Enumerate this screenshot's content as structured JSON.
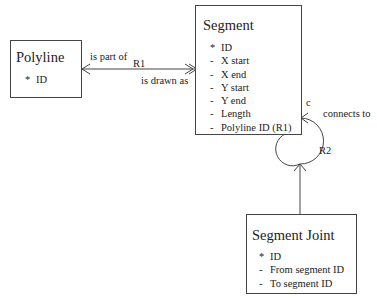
{
  "entities": {
    "polyline": {
      "title": "Polyline",
      "attributes": [
        {
          "marker": "*",
          "name": "ID"
        }
      ]
    },
    "segment": {
      "title": "Segment",
      "attributes": [
        {
          "marker": "*",
          "name": "ID"
        },
        {
          "marker": "-",
          "name": "X start"
        },
        {
          "marker": "-",
          "name": "X end"
        },
        {
          "marker": "-",
          "name": "Y start"
        },
        {
          "marker": "-",
          "name": "Y end"
        },
        {
          "marker": "-",
          "name": "Length"
        },
        {
          "marker": "-",
          "name": "Polyline ID (R1)"
        }
      ]
    },
    "segment_joint": {
      "title": "Segment Joint",
      "attributes": [
        {
          "marker": "*",
          "name": "ID"
        },
        {
          "marker": "-",
          "name": "From segment ID"
        },
        {
          "marker": "-",
          "name": "To segment ID"
        }
      ]
    }
  },
  "relationships": {
    "r1": {
      "id": "R1",
      "forward_label": "is part of",
      "reverse_label": "is drawn as"
    },
    "r2": {
      "id": "R2",
      "label": "connects to",
      "cond": "c"
    }
  }
}
